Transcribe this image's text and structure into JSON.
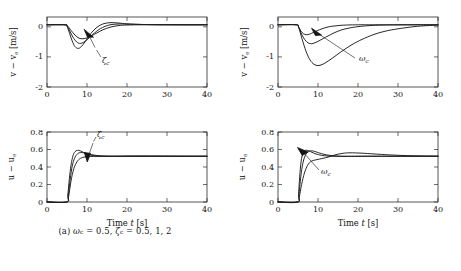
{
  "figure": {
    "panels": [
      {
        "id": "a",
        "caption": "(a) ωc = 0.5, ζc = 0.5, 1, 2",
        "caption_plain": "(a) ω_c = 0.5, ζ_c = 0.5, 1, 2"
      },
      {
        "id": "b",
        "caption": "(b) ζc = 1, ωc = 0.2, 0.5, 1",
        "caption_plain": "(b) ζ_c = 1, ω_c = 0.2, 0.5, 1"
      }
    ]
  },
  "axis_labels": {
    "time": "Time t [s]",
    "v_error": "v − ve [m/s]",
    "u_error": "u − ue"
  },
  "ticks": {
    "time": [
      "0",
      "10",
      "20",
      "30",
      "40"
    ],
    "v": [
      "-2",
      "-1",
      "0"
    ],
    "u": [
      "0",
      "0.2",
      "0.4",
      "0.6",
      "0.8"
    ]
  },
  "annotations": {
    "zeta_c": "ζc",
    "omega_c": "ωc"
  },
  "colors": {
    "curve": "#1c1c1c",
    "axis": "#2b2b2b",
    "background": "#ffffff"
  },
  "chart_data": [
    {
      "type": "line",
      "panel": "a",
      "subplot": "top-left",
      "title": "",
      "xlabel": "Time t [s]",
      "ylabel": "v − ve [m/s]",
      "xlim": [
        0,
        40
      ],
      "ylim": [
        -2,
        0.25
      ],
      "xticks": [
        0,
        10,
        20,
        30,
        40
      ],
      "yticks": [
        -2,
        -1,
        0
      ],
      "grid": false,
      "legend": "none",
      "annotation": "ζc (arrow points toward increasing ζc)",
      "series": [
        {
          "name": "zeta_c = 0.5",
          "x": [
            0,
            4.5,
            5.0,
            5.6,
            6.3,
            7.0,
            7.8,
            8.6,
            9.5,
            10.5,
            11.5,
            12.5,
            13.5,
            14.5,
            16,
            18,
            20,
            24,
            28,
            34,
            40
          ],
          "y": [
            0,
            0,
            -0.05,
            -0.26,
            -0.52,
            -0.7,
            -0.76,
            -0.7,
            -0.55,
            -0.36,
            -0.2,
            -0.08,
            0.0,
            0.045,
            0.07,
            0.055,
            0.03,
            0.01,
            0.003,
            0.0,
            0.0
          ]
        },
        {
          "name": "zeta_c = 1",
          "x": [
            0,
            4.5,
            5.0,
            5.7,
            6.5,
            7.4,
            8.3,
            9.2,
            10.2,
            11.2,
            12.3,
            13.4,
            14.5,
            16,
            18,
            20,
            24,
            28,
            34,
            40
          ],
          "y": [
            0,
            0,
            -0.04,
            -0.2,
            -0.4,
            -0.55,
            -0.6,
            -0.56,
            -0.46,
            -0.34,
            -0.22,
            -0.12,
            -0.05,
            0.005,
            0.025,
            0.02,
            0.008,
            0.002,
            0.0,
            0.0
          ]
        },
        {
          "name": "zeta_c = 2",
          "x": [
            0,
            4.5,
            5.1,
            6.0,
            7.0,
            8.0,
            9.0,
            10.0,
            11.2,
            12.5,
            14,
            16,
            18,
            20,
            24,
            28,
            34,
            40
          ],
          "y": [
            0,
            0,
            -0.03,
            -0.18,
            -0.33,
            -0.43,
            -0.45,
            -0.42,
            -0.35,
            -0.26,
            -0.16,
            -0.07,
            -0.025,
            -0.008,
            0.0,
            0.0,
            0.0,
            0.0
          ]
        }
      ]
    },
    {
      "type": "line",
      "panel": "a",
      "subplot": "bottom-left",
      "title": "",
      "xlabel": "Time t [s]",
      "ylabel": "u − ue",
      "xlim": [
        0,
        40
      ],
      "ylim": [
        0,
        0.8
      ],
      "xticks": [
        0,
        10,
        20,
        30,
        40
      ],
      "yticks": [
        0,
        0.2,
        0.4,
        0.6,
        0.8
      ],
      "grid": false,
      "legend": "none",
      "annotation": "ζc (arrow points downward toward increasing ζc)",
      "series": [
        {
          "name": "zeta_c = 0.5",
          "x": [
            0,
            4.9,
            5.2,
            5.6,
            6.0,
            6.5,
            7.0,
            7.6,
            8.3,
            9.2,
            10.2,
            11.5,
            13,
            15,
            17,
            20,
            24,
            28,
            34,
            40
          ],
          "y": [
            0,
            0,
            0.08,
            0.27,
            0.42,
            0.53,
            0.575,
            0.59,
            0.585,
            0.565,
            0.545,
            0.53,
            0.523,
            0.522,
            0.523,
            0.525,
            0.525,
            0.524,
            0.523,
            0.523
          ]
        },
        {
          "name": "zeta_c = 1",
          "x": [
            0,
            4.9,
            5.3,
            5.8,
            6.3,
            6.9,
            7.6,
            8.4,
            9.4,
            10.5,
            12,
            14,
            16,
            18,
            21,
            25,
            30,
            35,
            40
          ],
          "y": [
            0,
            0,
            0.07,
            0.26,
            0.41,
            0.5,
            0.55,
            0.565,
            0.56,
            0.548,
            0.534,
            0.526,
            0.523,
            0.522,
            0.523,
            0.524,
            0.524,
            0.523,
            0.523
          ]
        },
        {
          "name": "zeta_c = 2",
          "x": [
            0,
            4.9,
            5.4,
            6.0,
            6.7,
            7.5,
            8.4,
            9.5,
            10.8,
            12.5,
            14.5,
            17,
            20,
            24,
            28,
            34,
            40
          ],
          "y": [
            0,
            0,
            0.06,
            0.24,
            0.38,
            0.46,
            0.5,
            0.515,
            0.52,
            0.522,
            0.523,
            0.523,
            0.523,
            0.523,
            0.523,
            0.523,
            0.523
          ]
        }
      ]
    },
    {
      "type": "line",
      "panel": "b",
      "subplot": "top-right",
      "title": "",
      "xlabel": "Time t [s]",
      "ylabel": "v − ve [m/s]",
      "xlim": [
        0,
        40
      ],
      "ylim": [
        -2,
        0.25
      ],
      "xticks": [
        0,
        10,
        20,
        30,
        40
      ],
      "yticks": [
        -2,
        -1,
        0
      ],
      "grid": false,
      "legend": "none",
      "annotation": "ωc (arrow points toward increasing ωc)",
      "series": [
        {
          "name": "omega_c = 0.2",
          "x": [
            0,
            4.6,
            5.2,
            6.0,
            7.0,
            8.0,
            9.0,
            10.0,
            11.0,
            12.0,
            13.5,
            15,
            17,
            19,
            21,
            24,
            27,
            30,
            34,
            37,
            40
          ],
          "y": [
            0,
            0,
            -0.1,
            -0.45,
            -0.85,
            -1.13,
            -1.27,
            -1.31,
            -1.28,
            -1.21,
            -1.08,
            -0.94,
            -0.76,
            -0.6,
            -0.47,
            -0.31,
            -0.2,
            -0.13,
            -0.06,
            -0.03,
            -0.01
          ]
        },
        {
          "name": "omega_c = 0.5",
          "x": [
            0,
            4.6,
            5.2,
            5.9,
            6.7,
            7.5,
            8.3,
            9.2,
            10.2,
            11.3,
            12.5,
            14,
            16,
            18,
            20,
            23,
            26,
            30,
            35,
            40
          ],
          "y": [
            0,
            0,
            -0.08,
            -0.3,
            -0.48,
            -0.58,
            -0.61,
            -0.58,
            -0.52,
            -0.44,
            -0.36,
            -0.26,
            -0.16,
            -0.1,
            -0.06,
            -0.025,
            -0.01,
            -0.004,
            0.0,
            0.0
          ]
        },
        {
          "name": "omega_c = 1",
          "x": [
            0,
            4.6,
            5.1,
            5.7,
            6.4,
            7.1,
            7.9,
            8.8,
            9.8,
            11,
            12.5,
            14,
            16,
            18,
            21,
            25,
            30,
            35,
            40
          ],
          "y": [
            0,
            0,
            -0.06,
            -0.2,
            -0.29,
            -0.32,
            -0.3,
            -0.25,
            -0.19,
            -0.13,
            -0.07,
            -0.04,
            -0.015,
            -0.005,
            0.0,
            0.0,
            0.0,
            0.0,
            0.0
          ]
        }
      ]
    },
    {
      "type": "line",
      "panel": "b",
      "subplot": "bottom-right",
      "title": "",
      "xlabel": "Time t [s]",
      "ylabel": "u − ue",
      "xlim": [
        0,
        40
      ],
      "ylim": [
        0,
        0.8
      ],
      "xticks": [
        0,
        10,
        20,
        30,
        40
      ],
      "yticks": [
        0,
        0.2,
        0.4,
        0.6,
        0.8
      ],
      "grid": false,
      "legend": "none",
      "annotation": "ωc (arrow points toward increasing ωc)",
      "series": [
        {
          "name": "omega_c = 0.2",
          "x": [
            0,
            4.9,
            5.3,
            5.9,
            6.6,
            7.4,
            8.3,
            9.3,
            10.3,
            11.3,
            12.5,
            14,
            16,
            18,
            21,
            24,
            28,
            32,
            36,
            40
          ],
          "y": [
            0,
            0,
            0.05,
            0.2,
            0.33,
            0.42,
            0.465,
            0.48,
            0.49,
            0.5,
            0.513,
            0.535,
            0.555,
            0.562,
            0.558,
            0.549,
            0.538,
            0.53,
            0.526,
            0.524
          ]
        },
        {
          "name": "omega_c = 0.5",
          "x": [
            0,
            4.9,
            5.2,
            5.7,
            6.2,
            6.8,
            7.5,
            8.3,
            9.2,
            10.2,
            11.5,
            13,
            15,
            17,
            20,
            24,
            28,
            34,
            40
          ],
          "y": [
            0,
            0,
            0.07,
            0.29,
            0.44,
            0.53,
            0.575,
            0.585,
            0.578,
            0.562,
            0.545,
            0.532,
            0.525,
            0.522,
            0.522,
            0.523,
            0.523,
            0.523,
            0.523
          ]
        },
        {
          "name": "omega_c = 1",
          "x": [
            0,
            4.9,
            5.15,
            5.5,
            5.9,
            6.4,
            7.0,
            7.7,
            8.5,
            9.5,
            10.8,
            12.5,
            14.5,
            17,
            20,
            25,
            30,
            35,
            40
          ],
          "y": [
            0,
            0,
            0.1,
            0.34,
            0.5,
            0.575,
            0.592,
            0.585,
            0.568,
            0.549,
            0.534,
            0.525,
            0.522,
            0.522,
            0.523,
            0.523,
            0.523,
            0.523,
            0.523
          ]
        }
      ]
    }
  ]
}
